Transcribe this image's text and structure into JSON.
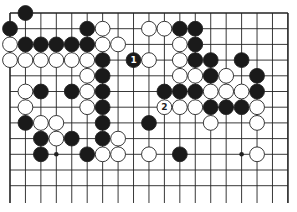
{
  "diagram": {
    "type": "go-board-partial",
    "colors": {
      "background": "#ffffff",
      "line": "#222222",
      "black": "#1a1a1a",
      "white": "#ffffff"
    },
    "grid": {
      "columns": 19,
      "visible_rows": 12,
      "origin_x": 10,
      "origin_y": 13,
      "spacing_x": 15.44,
      "spacing_y": 15.7,
      "line_extend_bottom": 203,
      "edges": {
        "top": true,
        "left": true,
        "right": true,
        "bottom": false
      }
    },
    "star_points": [
      {
        "col": 3,
        "row": 9
      },
      {
        "col": 15,
        "row": 9
      }
    ],
    "stones": [
      {
        "col": 1,
        "row": 0,
        "color": "black"
      },
      {
        "col": 0,
        "row": 1,
        "color": "black"
      },
      {
        "col": 5,
        "row": 1,
        "color": "black"
      },
      {
        "col": 6,
        "row": 1,
        "color": "white"
      },
      {
        "col": 9,
        "row": 1,
        "color": "white"
      },
      {
        "col": 10,
        "row": 1,
        "color": "white"
      },
      {
        "col": 11,
        "row": 1,
        "color": "black"
      },
      {
        "col": 12,
        "row": 1,
        "color": "black"
      },
      {
        "col": 0,
        "row": 2,
        "color": "white"
      },
      {
        "col": 1,
        "row": 2,
        "color": "black"
      },
      {
        "col": 2,
        "row": 2,
        "color": "black"
      },
      {
        "col": 3,
        "row": 2,
        "color": "black"
      },
      {
        "col": 4,
        "row": 2,
        "color": "black"
      },
      {
        "col": 5,
        "row": 2,
        "color": "black"
      },
      {
        "col": 6,
        "row": 2,
        "color": "white"
      },
      {
        "col": 7,
        "row": 2,
        "color": "white"
      },
      {
        "col": 11,
        "row": 2,
        "color": "white"
      },
      {
        "col": 12,
        "row": 2,
        "color": "black"
      },
      {
        "col": 0,
        "row": 3,
        "color": "white"
      },
      {
        "col": 1,
        "row": 3,
        "color": "white"
      },
      {
        "col": 2,
        "row": 3,
        "color": "white"
      },
      {
        "col": 3,
        "row": 3,
        "color": "white"
      },
      {
        "col": 4,
        "row": 3,
        "color": "white"
      },
      {
        "col": 5,
        "row": 3,
        "color": "white"
      },
      {
        "col": 6,
        "row": 3,
        "color": "black"
      },
      {
        "col": 8,
        "row": 3,
        "color": "black",
        "label": "1"
      },
      {
        "col": 9,
        "row": 3,
        "color": "white"
      },
      {
        "col": 11,
        "row": 3,
        "color": "white"
      },
      {
        "col": 12,
        "row": 3,
        "color": "black"
      },
      {
        "col": 13,
        "row": 3,
        "color": "black"
      },
      {
        "col": 15,
        "row": 3,
        "color": "black"
      },
      {
        "col": 5,
        "row": 4,
        "color": "white"
      },
      {
        "col": 6,
        "row": 4,
        "color": "black"
      },
      {
        "col": 11,
        "row": 4,
        "color": "white"
      },
      {
        "col": 12,
        "row": 4,
        "color": "white"
      },
      {
        "col": 13,
        "row": 4,
        "color": "black"
      },
      {
        "col": 14,
        "row": 4,
        "color": "white"
      },
      {
        "col": 16,
        "row": 4,
        "color": "black"
      },
      {
        "col": 1,
        "row": 5,
        "color": "white"
      },
      {
        "col": 2,
        "row": 5,
        "color": "black"
      },
      {
        "col": 4,
        "row": 5,
        "color": "black"
      },
      {
        "col": 5,
        "row": 5,
        "color": "white"
      },
      {
        "col": 6,
        "row": 5,
        "color": "black"
      },
      {
        "col": 10,
        "row": 5,
        "color": "black"
      },
      {
        "col": 11,
        "row": 5,
        "color": "black"
      },
      {
        "col": 12,
        "row": 5,
        "color": "black"
      },
      {
        "col": 13,
        "row": 5,
        "color": "white"
      },
      {
        "col": 14,
        "row": 5,
        "color": "white"
      },
      {
        "col": 15,
        "row": 5,
        "color": "white"
      },
      {
        "col": 16,
        "row": 5,
        "color": "black"
      },
      {
        "col": 1,
        "row": 6,
        "color": "white"
      },
      {
        "col": 5,
        "row": 6,
        "color": "white"
      },
      {
        "col": 6,
        "row": 6,
        "color": "black"
      },
      {
        "col": 10,
        "row": 6,
        "color": "white",
        "label": "2"
      },
      {
        "col": 11,
        "row": 6,
        "color": "white"
      },
      {
        "col": 12,
        "row": 6,
        "color": "white"
      },
      {
        "col": 13,
        "row": 6,
        "color": "black"
      },
      {
        "col": 14,
        "row": 6,
        "color": "black"
      },
      {
        "col": 15,
        "row": 6,
        "color": "black"
      },
      {
        "col": 16,
        "row": 6,
        "color": "white"
      },
      {
        "col": 1,
        "row": 7,
        "color": "black"
      },
      {
        "col": 2,
        "row": 7,
        "color": "white"
      },
      {
        "col": 3,
        "row": 7,
        "color": "white"
      },
      {
        "col": 6,
        "row": 7,
        "color": "black"
      },
      {
        "col": 9,
        "row": 7,
        "color": "black"
      },
      {
        "col": 13,
        "row": 7,
        "color": "white"
      },
      {
        "col": 16,
        "row": 7,
        "color": "white"
      },
      {
        "col": 2,
        "row": 8,
        "color": "black"
      },
      {
        "col": 3,
        "row": 8,
        "color": "white"
      },
      {
        "col": 4,
        "row": 8,
        "color": "black"
      },
      {
        "col": 6,
        "row": 8,
        "color": "black"
      },
      {
        "col": 7,
        "row": 8,
        "color": "white"
      },
      {
        "col": 2,
        "row": 9,
        "color": "black"
      },
      {
        "col": 5,
        "row": 9,
        "color": "black"
      },
      {
        "col": 6,
        "row": 9,
        "color": "white"
      },
      {
        "col": 7,
        "row": 9,
        "color": "white"
      },
      {
        "col": 9,
        "row": 9,
        "color": "white"
      },
      {
        "col": 11,
        "row": 9,
        "color": "black"
      },
      {
        "col": 16,
        "row": 9,
        "color": "white"
      }
    ],
    "move_labels": [
      "1",
      "2"
    ]
  }
}
